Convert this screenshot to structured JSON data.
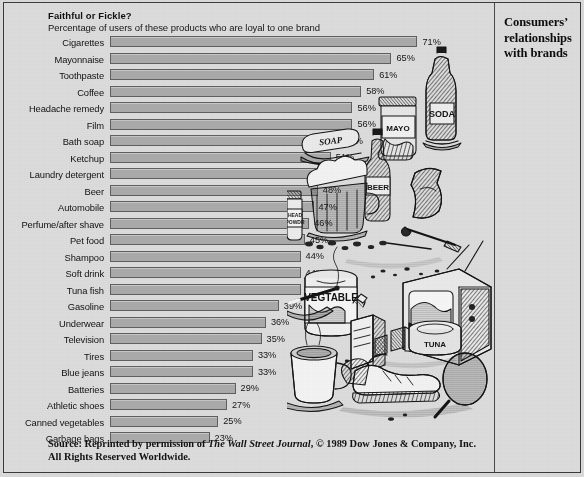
{
  "figure": {
    "title": "Faithful or Fickle?",
    "subtitle": "Percentage of users of these products who are loyal to one brand",
    "caption_line1": "Consumers’",
    "caption_line2": "relationships",
    "caption_line3": "with brands",
    "source_prefix": "Source: Reprinted by permission of ",
    "source_italic": "The Wall Street Journal",
    "source_suffix": ", © 1989 Dow Jones & Company, Inc. All Rights Reserved Worldwide.",
    "illustration_alt": "pen-and-ink drawing of assorted consumer products: soda bottle, mayonnaise jar, soap bar, beer glass and bottle, medicine bottle, potato chip bag, vegetable can, television set, cigarette pack and lit cigarette, tuna can, coffee mug, athletic shoes, tennis racket"
  },
  "colors": {
    "page_background": "#dcdcdc",
    "bar_fill": "#aaaaaa",
    "bar_stroke": "#606060",
    "frame_stroke": "#3a3a3a",
    "text": "#111111",
    "ink": "#1a1a1a"
  },
  "chart_data": {
    "type": "bar",
    "orientation": "horizontal",
    "title": "Faithful or Fickle?",
    "subtitle": "Percentage of users of these products who are loyal to one brand",
    "xlabel": "",
    "ylabel": "",
    "xlim": [
      0,
      75
    ],
    "grid": false,
    "legend": "none",
    "value_suffix": "%",
    "categories": [
      "Cigarettes",
      "Mayonnaise",
      "Toothpaste",
      "Coffee",
      "Headache remedy",
      "Film",
      "Bath soap",
      "Ketchup",
      "Laundry detergent",
      "Beer",
      "Automobile",
      "Perfume/after shave",
      "Pet food",
      "Shampoo",
      "Soft drink",
      "Tuna fish",
      "Gasoline",
      "Underwear",
      "Television",
      "Tires",
      "Blue jeans",
      "Batteries",
      "Athletic shoes",
      "Canned vegetables",
      "Garbage bags"
    ],
    "values": [
      71,
      65,
      61,
      58,
      56,
      56,
      53,
      51,
      48,
      48,
      47,
      46,
      45,
      44,
      44,
      44,
      39,
      36,
      35,
      33,
      33,
      29,
      27,
      25,
      23
    ],
    "value_labels": [
      "71%",
      "65%",
      "61%",
      "58%",
      "56%",
      "56%",
      "53%",
      "51%",
      "48%",
      "48%",
      "47%",
      "46%",
      "45%",
      "44%",
      "44%",
      "44%",
      "39%",
      "36%",
      "35%",
      "33%",
      "33%",
      "29%",
      "27%",
      "25%",
      "23%"
    ]
  }
}
